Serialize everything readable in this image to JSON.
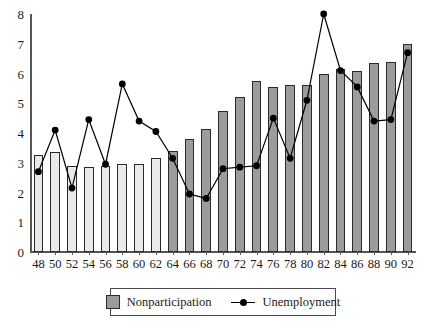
{
  "chart_data": {
    "type": "bar",
    "title": "",
    "subtitle": "",
    "xlabel": "",
    "ylabel": "",
    "categories": [
      "48",
      "50",
      "52",
      "54",
      "56",
      "58",
      "60",
      "62",
      "64",
      "66",
      "68",
      "70",
      "72",
      "74",
      "76",
      "78",
      "80",
      "82",
      "84",
      "86",
      "88",
      "90",
      "92"
    ],
    "xtick_labels": [
      "48",
      "50",
      "52",
      "54",
      "56",
      "58",
      "60",
      "62",
      "64",
      "66",
      "68",
      "70",
      "72",
      "74",
      "76",
      "78",
      "80",
      "82",
      "84",
      "86",
      "88",
      "90",
      "92"
    ],
    "ylim": [
      0,
      8
    ],
    "ytick_labels": [
      "0",
      "1",
      "2",
      "3",
      "4",
      "5",
      "6",
      "7",
      "8"
    ],
    "ytick_values": [
      0,
      1,
      2,
      3,
      4,
      5,
      6,
      7,
      8
    ],
    "grid": false,
    "legend_position": "bottom-center",
    "series": [
      {
        "name": "Nonparticipation",
        "type": "bar",
        "color_light": "#e9e9e9",
        "color_dark": "#9c9c9c",
        "shade_switch_category": "64",
        "values": [
          3.25,
          3.35,
          2.9,
          2.85,
          2.9,
          2.95,
          2.95,
          3.15,
          3.4,
          3.8,
          4.15,
          4.75,
          5.2,
          5.75,
          5.55,
          5.6,
          5.6,
          6.0,
          6.15,
          6.1,
          6.35,
          6.4,
          7.0
        ]
      },
      {
        "name": "Unemployment",
        "type": "line",
        "color": "#000000",
        "marker": "circle",
        "values": [
          2.7,
          4.1,
          2.15,
          4.45,
          2.95,
          5.65,
          4.4,
          4.05,
          3.15,
          1.95,
          1.8,
          2.8,
          2.85,
          2.9,
          4.5,
          3.15,
          5.1,
          8.0,
          6.1,
          5.55,
          4.4,
          4.45,
          6.7
        ]
      }
    ]
  },
  "legend": {
    "items": [
      {
        "label": "Nonparticipation",
        "marker": "square-swatch"
      },
      {
        "label": "Unemployment",
        "marker": "line-dot"
      }
    ]
  }
}
